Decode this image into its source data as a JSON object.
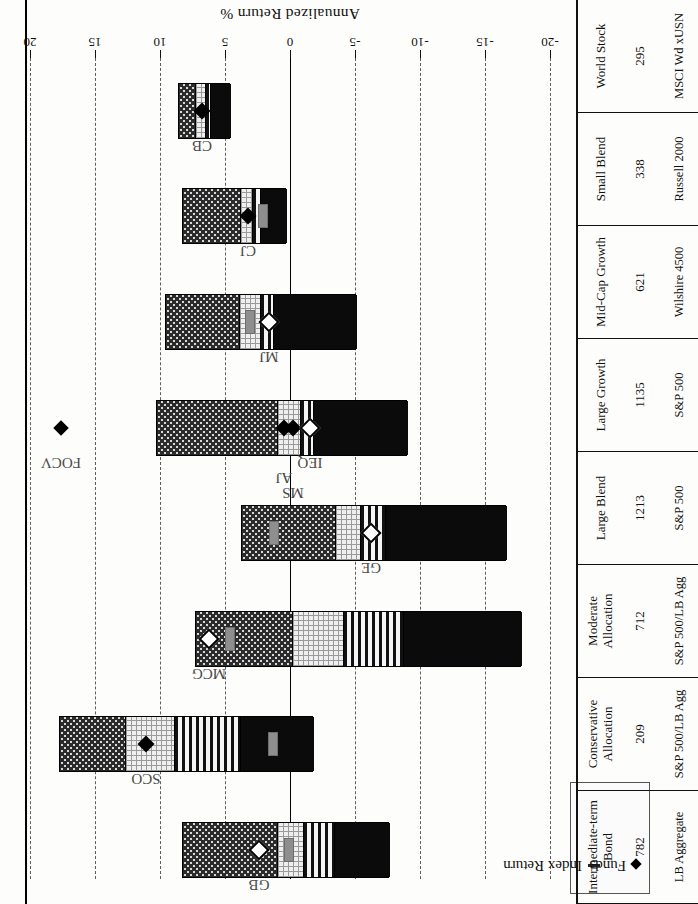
{
  "figure": {
    "axis_title": "Annualized Return %",
    "legend": {
      "funds_label": "Funds",
      "index_label": "Index Return",
      "funds_glyph": "diamond-marker-icon",
      "index_glyph": "dash-marker-icon"
    }
  },
  "chart_data": {
    "type": "bar",
    "xlabel": "",
    "ylabel": "Annualized Return %",
    "ylim": [
      -20,
      20
    ],
    "yticks": [
      20,
      15,
      10,
      5,
      0,
      -5,
      -10,
      -15,
      -20
    ],
    "ytick_labels": [
      "20",
      "15",
      "10",
      "5",
      "0",
      "-5",
      "-10",
      "-15",
      "-20"
    ],
    "grid": true,
    "orientation": "horizontal-boxes-rotated",
    "legend_position": "top-left",
    "categories": [
      {
        "name": "Intermediate-term Bond",
        "count": "782",
        "benchmark": "LB Aggregate",
        "box": {
          "max": 8.6,
          "q3": 7.4,
          "median": 6.6,
          "q1": 6.2,
          "min": 4.6
        },
        "index_return": null,
        "funds": [
          {
            "label": "CB",
            "value": 6.8,
            "marker": "filled"
          }
        ]
      },
      {
        "name": "Conservative Allocation",
        "count": "209",
        "benchmark": "S&P 500/LB Agg",
        "box": {
          "max": 8.3,
          "q3": 3.9,
          "median": 3.0,
          "q1": 2.4,
          "min": 0.3
        },
        "index_return": 2.1,
        "funds": [
          {
            "label": "CJ",
            "value": 3.2,
            "marker": "filled"
          }
        ]
      },
      {
        "name": "Moderate Allocation",
        "count": "712",
        "benchmark": "S&P 500/LB Agg",
        "box": {
          "max": 9.6,
          "q3": 4.0,
          "median": 2.4,
          "q1": 1.4,
          "min": -5.1
        },
        "index_return": 3.1,
        "funds": [
          {
            "label": "MJ",
            "value": 1.6,
            "marker": "open"
          }
        ]
      },
      {
        "name": "Large Blend",
        "count": "1213",
        "benchmark": "S&P 500",
        "box": {
          "max": 10.3,
          "q3": 1.1,
          "median": -0.7,
          "q1": -1.7,
          "min": -9.0
        },
        "index_return": null,
        "funds": [
          {
            "label": "FOCV",
            "value": 17.6,
            "marker": "filled",
            "outlier": true
          },
          {
            "label": "AJ",
            "value": 0.5,
            "marker": "filled"
          },
          {
            "label": "MS",
            "value": -0.2,
            "marker": "filled"
          },
          {
            "label": "IEQ",
            "value": -1.5,
            "marker": "open"
          }
        ]
      },
      {
        "name": "Large Growth",
        "count": "1135",
        "benchmark": "S&P 500",
        "box": {
          "max": 3.8,
          "q3": -3.4,
          "median": -5.3,
          "q1": -7.2,
          "min": -16.6
        },
        "index_return": 1.2,
        "funds": [
          {
            "label": "GE",
            "value": -6.2,
            "marker": "open"
          }
        ]
      },
      {
        "name": "Mid-Cap Growth",
        "count": "621",
        "benchmark": "Wilshire 4500",
        "box": {
          "max": 7.3,
          "q3": -0.1,
          "median": -4.0,
          "q1": -8.6,
          "min": -17.8
        },
        "index_return": 4.6,
        "funds": [
          {
            "label": "MCG",
            "value": 6.2,
            "marker": "open"
          }
        ]
      },
      {
        "name": "Small Blend",
        "count": "338",
        "benchmark": "Russell 2000",
        "box": {
          "max": 17.8,
          "q3": 12.8,
          "median": 9.0,
          "q1": 3.9,
          "min": -1.8
        },
        "index_return": 1.3,
        "funds": [
          {
            "label": "SCO",
            "value": 11.1,
            "marker": "filled"
          }
        ]
      },
      {
        "name": "World Stock",
        "count": "295",
        "benchmark": "MSCI Wd xUSN",
        "box": {
          "max": 8.3,
          "q3": 1.1,
          "median": -0.9,
          "q1": -3.3,
          "min": -7.6
        },
        "index_return": 0.1,
        "funds": [
          {
            "label": "GB",
            "value": 2.4,
            "marker": "open"
          }
        ]
      }
    ]
  },
  "table": {
    "row_fields": [
      "name",
      "count",
      "benchmark"
    ]
  }
}
